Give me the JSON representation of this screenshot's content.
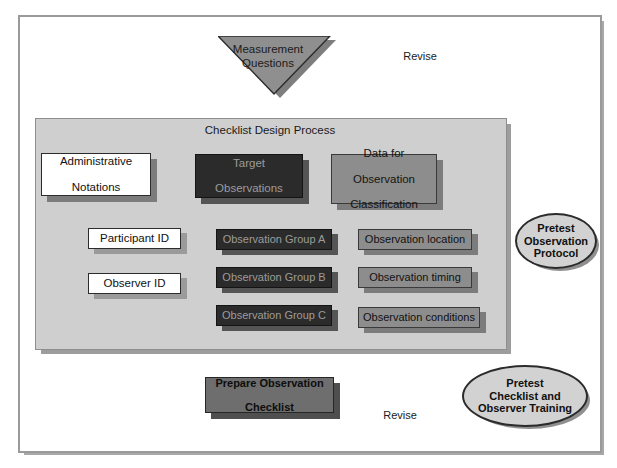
{
  "diagram": {
    "title": "Checklist Design Process",
    "frame": {
      "name": "outer-frame"
    },
    "input_shape": {
      "label_line1": "Measurement",
      "label_line2": "Questions",
      "shape": "inverted-triangle"
    },
    "top_level_boxes": [
      {
        "id": "administrative-notations",
        "label_line1": "Administrative",
        "label_line2": "Notations",
        "style": "white"
      },
      {
        "id": "target-observations",
        "label_line1": "Target",
        "label_line2": "Observations",
        "style": "dark"
      },
      {
        "id": "data-for-observation-classification",
        "label_line1": "Data for",
        "label_line2": "Observation",
        "label_line3": "Classification",
        "style": "grey"
      }
    ],
    "column_left": [
      {
        "id": "participant-id",
        "label": "Participant ID",
        "style": "white"
      },
      {
        "id": "observer-id",
        "label": "Observer ID",
        "style": "white"
      }
    ],
    "column_middle": [
      {
        "id": "observation-group-a",
        "label": "Observation Group A",
        "style": "dark"
      },
      {
        "id": "observation-group-b",
        "label": "Observation Group B",
        "style": "dark"
      },
      {
        "id": "observation-group-c",
        "label": "Observation Group C",
        "style": "dark"
      }
    ],
    "column_right": [
      {
        "id": "observation-location",
        "label": "Observation location",
        "style": "grey"
      },
      {
        "id": "observation-timing",
        "label": "Observation timing",
        "style": "grey"
      },
      {
        "id": "observation-conditions",
        "label": "Observation conditions",
        "style": "grey"
      }
    ],
    "pretest_protocol": {
      "line1": "Pretest",
      "line2": "Observation",
      "line3": "Protocol"
    },
    "prepare_checklist": {
      "line1": "Prepare Observation",
      "line2": "Checklist"
    },
    "pretest_training": {
      "line1": "Pretest",
      "line2": "Checklist and",
      "line3": "Observer Training"
    },
    "edge_labels": {
      "revise_top": "Revise",
      "revise_bottom": "Revise"
    },
    "colors": {
      "panel_background": "#cfcfcf",
      "dark_box": "#2b2b2b",
      "grey_box": "#8d8d8d",
      "white_box": "#ffffff",
      "ellipse_fill": "#d2d2d2",
      "frame_border": "#9a9a9a",
      "line": "#1a1a1a"
    }
  }
}
